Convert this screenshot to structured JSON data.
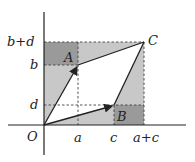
{
  "diagram": {
    "points": {
      "O": {
        "label": "O"
      },
      "A": {
        "label": "A"
      },
      "B": {
        "label": "B"
      },
      "C": {
        "label": "C"
      }
    },
    "x_ticks": [
      "a",
      "c",
      "a+c"
    ],
    "y_ticks": [
      "b+d",
      "b",
      "d"
    ],
    "colors": {
      "dark_fill": "#9a9a9a",
      "light_fill": "#c8c8c8",
      "line": "#222222",
      "dashed": "#444444"
    }
  }
}
